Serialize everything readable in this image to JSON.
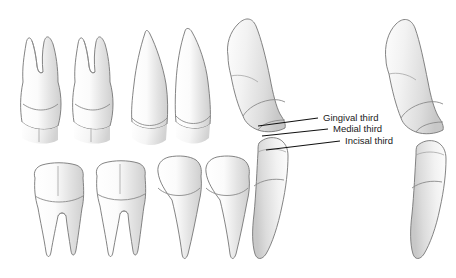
{
  "figure": {
    "background_color": "#ffffff",
    "outline_color": "#6e6e6e",
    "leader_color": "#111111",
    "tooth_fill_light": "#ffffff",
    "tooth_fill_shadow": "#d4d4d4",
    "label_color": "#1a1a1a"
  },
  "annotations": {
    "labels": [
      {
        "id": "gingival",
        "text": "Gingival third",
        "x": 323,
        "y": 121,
        "leader_from_x": 258,
        "leader_from_y": 126,
        "leader_to_x": 318,
        "leader_to_y": 118
      },
      {
        "id": "medial",
        "text": "Medial third",
        "x": 333,
        "y": 132,
        "leader_from_x": 262,
        "leader_from_y": 136,
        "leader_to_x": 328,
        "leader_to_y": 129
      },
      {
        "id": "incisal",
        "text": "Incisal third",
        "x": 345,
        "y": 144,
        "leader_from_x": 266,
        "leader_from_y": 150,
        "leader_to_x": 340,
        "leader_to_y": 141
      }
    ]
  },
  "groups": {
    "upper_row": {
      "name": "Upper arch teeth, roots upward",
      "teeth": [
        {
          "id": "upper-molar-1",
          "type": "molar",
          "roots": 2
        },
        {
          "id": "upper-molar-2",
          "type": "molar",
          "roots": 2
        },
        {
          "id": "upper-premolar-1",
          "type": "single-rooted",
          "roots": 1
        },
        {
          "id": "upper-premolar-2",
          "type": "single-rooted",
          "roots": 1
        }
      ]
    },
    "lower_row": {
      "name": "Lower arch teeth, roots downward",
      "teeth": [
        {
          "id": "lower-molar-1",
          "type": "molar",
          "roots": 2
        },
        {
          "id": "lower-molar-2",
          "type": "molar",
          "roots": 2
        },
        {
          "id": "lower-premolar-1",
          "type": "single-rooted",
          "roots": 1
        },
        {
          "id": "lower-premolar-2",
          "type": "single-rooted",
          "roots": 1
        }
      ]
    },
    "center_pair": {
      "name": "Center incisor pair, proximal view, annotated",
      "teeth": [
        {
          "id": "center-upper-incisor",
          "type": "incisor",
          "position": "upper"
        },
        {
          "id": "center-lower-incisor",
          "type": "incisor",
          "position": "lower"
        }
      ]
    },
    "right_pair": {
      "name": "Right incisor pair, proximal view",
      "teeth": [
        {
          "id": "right-upper-incisor",
          "type": "incisor",
          "position": "upper"
        },
        {
          "id": "right-lower-incisor",
          "type": "incisor",
          "position": "lower"
        }
      ]
    }
  }
}
